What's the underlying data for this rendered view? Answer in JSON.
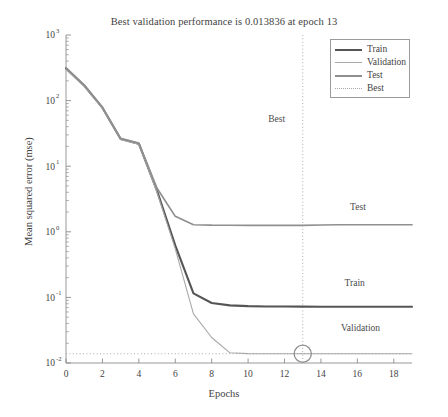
{
  "chart_data": {
    "type": "line",
    "title": "Best validation performance is 0.013836 at epoch 13",
    "xlabel": "Epochs",
    "ylabel": "Mean squared error (mse)",
    "yscale": "log",
    "xlim": [
      0,
      19
    ],
    "ylim": [
      0.01,
      1000
    ],
    "grid": false,
    "legend_position": "top-right",
    "xticks": [
      "0",
      "2",
      "4",
      "6",
      "8",
      "10",
      "12",
      "14",
      "16",
      "18"
    ],
    "xtick_values": [
      0,
      2,
      4,
      6,
      8,
      10,
      12,
      14,
      16,
      18
    ],
    "ytick_labels": [
      "10",
      "10",
      "10",
      "10",
      "10",
      "10"
    ],
    "ytick_exponents": [
      "3",
      "2",
      "1",
      "0",
      "-1",
      "-2"
    ],
    "ytick_values": [
      1000,
      100,
      10,
      1,
      0.1,
      0.01
    ],
    "x": [
      0,
      1,
      2,
      3,
      4,
      5,
      6,
      7,
      8,
      9,
      10,
      11,
      12,
      13,
      14,
      15,
      16,
      17,
      18,
      19
    ],
    "series": [
      {
        "name": "Train",
        "color": "#555555",
        "width": 2.1,
        "values": [
          310,
          170,
          78,
          26,
          22,
          4.2,
          0.62,
          0.115,
          0.082,
          0.0755,
          0.0735,
          0.0728,
          0.0725,
          0.0723,
          0.0722,
          0.0722,
          0.0721,
          0.0721,
          0.0721,
          0.0721
        ]
      },
      {
        "name": "Validation",
        "color": "#a8a8a8",
        "width": 1.1,
        "values": [
          300,
          165,
          76,
          25.5,
          21.5,
          4.0,
          0.55,
          0.056,
          0.0245,
          0.0143,
          0.0139,
          0.01385,
          0.013845,
          0.013836,
          0.013838,
          0.01384,
          0.01384,
          0.013842,
          0.013843,
          0.013844
        ]
      },
      {
        "name": "Test",
        "color": "#8f8f8f",
        "width": 1.7,
        "values": [
          315,
          172,
          79,
          26.5,
          22.5,
          4.6,
          1.72,
          1.28,
          1.26,
          1.258,
          1.257,
          1.256,
          1.256,
          1.256,
          1.27,
          1.28,
          1.28,
          1.28,
          1.28,
          1.28
        ]
      }
    ],
    "best": {
      "label": "Best",
      "color": "#b0a8a8",
      "epoch": 13,
      "value": 0.013836
    },
    "annotations": [
      {
        "text": "Best",
        "x": 11.1,
        "y_px": 122
      },
      {
        "text": "Test",
        "x": 15.6,
        "y_px": 210
      },
      {
        "text": "Train",
        "x": 15.3,
        "y_px": 286
      },
      {
        "text": "Validation",
        "x": 15.1,
        "y_px": 331
      }
    ]
  },
  "legend": {
    "items": [
      {
        "label": "Train",
        "color": "#555555",
        "style": "solid",
        "width": 2.1
      },
      {
        "label": "Validation",
        "color": "#a8a8a8",
        "style": "solid",
        "width": 1.1
      },
      {
        "label": "Test",
        "color": "#8f8f8f",
        "style": "solid",
        "width": 1.7
      },
      {
        "label": "Best",
        "color": "#b0a8a8",
        "style": "dotted",
        "width": 1
      }
    ]
  }
}
